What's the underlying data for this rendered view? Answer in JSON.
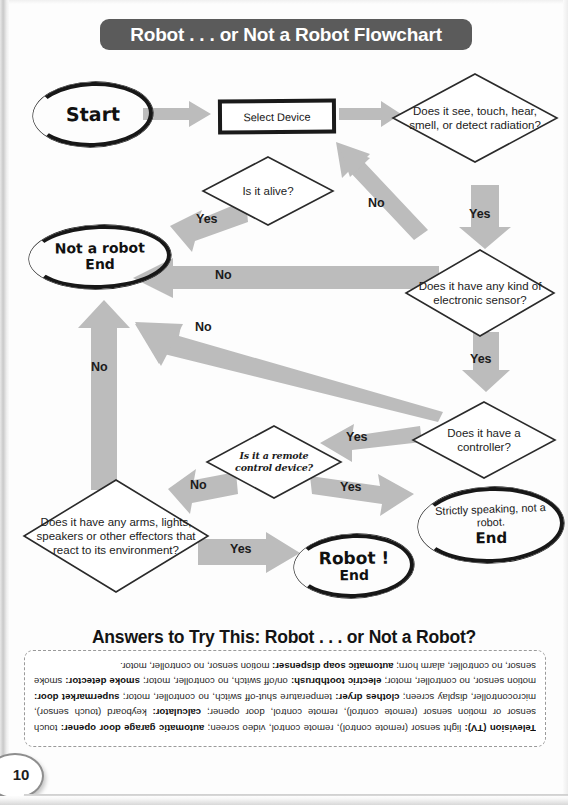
{
  "page": {
    "title": "Robot . . . or Not a Robot Flowchart",
    "number": "10"
  },
  "flowchart": {
    "nodes": [
      {
        "id": "start",
        "type": "terminator-hand",
        "text": "Start"
      },
      {
        "id": "select",
        "type": "process",
        "text": "Select Device"
      },
      {
        "id": "senses",
        "type": "decision",
        "text": "Does it see, touch, hear, smell, or detect radiation?"
      },
      {
        "id": "alive",
        "type": "decision",
        "text": "Is it alive?"
      },
      {
        "id": "notrobot",
        "type": "terminator-hand",
        "text": "Not a robot",
        "sub": "End"
      },
      {
        "id": "sensor",
        "type": "decision",
        "text": "Does it have any kind of electronic sensor?"
      },
      {
        "id": "controller",
        "type": "decision",
        "text": "Does it have a controller?"
      },
      {
        "id": "remote",
        "type": "decision-script",
        "text": "Is it a remote control device?"
      },
      {
        "id": "effectors",
        "type": "decision",
        "text": "Does it have any arms, lights, speakers or other effectors that react to its environment?"
      },
      {
        "id": "strictly",
        "type": "terminator-hand",
        "text": "Strictly speaking, not a robot.",
        "sub": "End"
      },
      {
        "id": "robot",
        "type": "terminator-hand",
        "text": "Robot !",
        "sub": "End"
      }
    ],
    "arrows": [
      {
        "id": "start-to-select",
        "label": ""
      },
      {
        "id": "select-to-senses",
        "label": ""
      },
      {
        "id": "senses-yes-down",
        "label": "Yes"
      },
      {
        "id": "senses-no-to-alive",
        "label": "No"
      },
      {
        "id": "alive-yes-left",
        "label": "Yes"
      },
      {
        "id": "sensor-no-left",
        "label": "No"
      },
      {
        "id": "sensor-yes-down",
        "label": "Yes"
      },
      {
        "id": "controller-no-upleft",
        "label": "No"
      },
      {
        "id": "effectors-no-up",
        "label": "No"
      },
      {
        "id": "remote-no-left",
        "label": "No"
      },
      {
        "id": "controller-yes-left",
        "label": "Yes"
      },
      {
        "id": "remote-yes-right",
        "label": "Yes"
      },
      {
        "id": "effectors-yes-right",
        "label": "Yes"
      }
    ]
  },
  "answers": {
    "heading": "Answers to Try This: Robot . . . or Not a Robot?",
    "body_html": "<b>Television (TV):</b> light sensor (remote control), remote control, video screen; <b>automatic garage door opener:</b> touch sensor or motion sensor (remote control), remote control, door opener; <b>calculator:</b> keyboard (touch sensor), microcontroller, display screen; <b>clothes dryer:</b> temperature shut-off switch, no controller, motor; <b>supermarket door:</b> motion sensor, no controller, motor; <b>electric toothbrush:</b> on/off switch, no controller, motor; <b>smoke detector:</b> smoke sensor, no controller, alarm horn; <b>automatic soap dispenser:</b> motion sensor, no controller, motor."
  },
  "colors": {
    "banner": "#5b5b5b",
    "arrow": "#bcbcbc",
    "ink": "#171717"
  }
}
